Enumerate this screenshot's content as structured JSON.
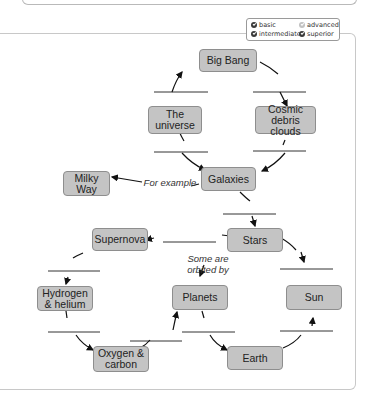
{
  "legend": {
    "items": [
      {
        "label": "basic",
        "checked": true
      },
      {
        "label": "advanced",
        "checked": false
      },
      {
        "label": "intermediate",
        "checked": true
      },
      {
        "label": "superior",
        "checked": true
      }
    ]
  },
  "diagram": {
    "nodes": {
      "big_bang": "Big Bang",
      "universe": "The universe",
      "cosmic": "Cosmic debris clouds",
      "galaxies": "Galaxies",
      "milky_way": "Milky Way",
      "stars": "Stars",
      "supernova": "Supernova",
      "planets": "Planets",
      "sun": "Sun",
      "hydrogen": "Hydrogen & helium",
      "oxygen": "Oxygen & carbon",
      "earth": "Earth"
    },
    "labels": {
      "for_example": "For example",
      "some_are": "Some are orbited by"
    }
  }
}
